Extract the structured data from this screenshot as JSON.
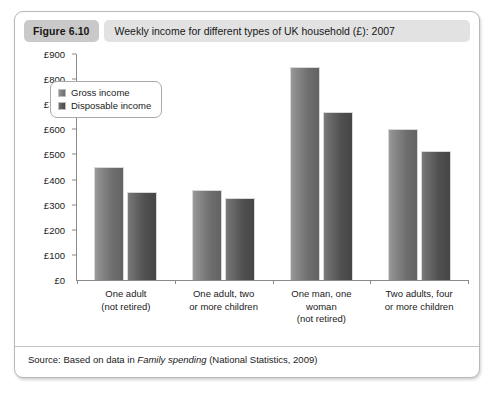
{
  "figure": {
    "number_label": "Figure 6.10",
    "title": "Weekly income for different types of UK household (£): 2007",
    "source": {
      "prefix": "Source: Based on data in ",
      "italic_title": "Family spending",
      "suffix": " (National Statistics, 2009)"
    }
  },
  "chart_data": {
    "type": "bar",
    "title": "Weekly income for different types of UK household (£): 2007",
    "xlabel": "",
    "ylabel": "",
    "ylim": [
      0,
      900
    ],
    "ytick_labels": [
      "£900",
      "£800",
      "£700",
      "£600",
      "£500",
      "£400",
      "£300",
      "£200",
      "£100",
      "£0"
    ],
    "ytick_values": [
      900,
      800,
      700,
      600,
      500,
      400,
      300,
      200,
      100,
      0
    ],
    "grid": false,
    "legend_position": "upper-left-inside",
    "categories": [
      "One adult\n(not retired)",
      "One adult, two\nor more children",
      "One man, one\nwoman\n(not retired)",
      "Two adults, four\nor more children"
    ],
    "category_lines": [
      [
        "One adult",
        "(not retired)"
      ],
      [
        "One adult, two",
        "or more children"
      ],
      [
        "One man, one",
        "woman",
        "(not retired)"
      ],
      [
        "Two adults, four",
        "or more children"
      ]
    ],
    "series": [
      {
        "name": "Gross income",
        "color": "#8a8a8a",
        "values": [
          450,
          360,
          850,
          600
        ]
      },
      {
        "name": "Disposable income",
        "color": "#5a5a5a",
        "values": [
          350,
          325,
          670,
          515
        ]
      }
    ]
  }
}
